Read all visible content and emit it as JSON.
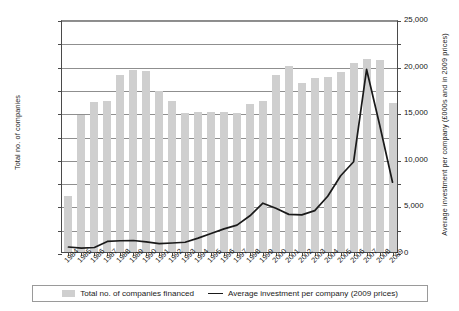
{
  "chart_data": {
    "type": "bar",
    "title": "",
    "subtitle": "",
    "xlabel": "",
    "ylabel": "Total no. of companies",
    "y2label": "Average investment per company (£000s and in 2009 prices)",
    "grid": true,
    "legend_position": "bottom",
    "ylim": [
      0,
      2000
    ],
    "y2lim": [
      0,
      25000
    ],
    "ytick_labels": [
      "0",
      "200",
      "400",
      "600",
      "800",
      "1,000",
      "1,200",
      "1,400",
      "1,600",
      "1,800",
      "2,000"
    ],
    "ytick_values": [
      0,
      200,
      400,
      600,
      800,
      1000,
      1200,
      1400,
      1600,
      1800,
      2000
    ],
    "y2tick_labels": [
      "0",
      "5,000",
      "10,000",
      "15,000",
      "20,000",
      "25,000"
    ],
    "y2tick_values": [
      0,
      5000,
      10000,
      15000,
      20000,
      25000
    ],
    "y2minor_values": [
      2500,
      7500,
      12500,
      17500,
      22500
    ],
    "categories": [
      "1984",
      "1985",
      "1986",
      "1987",
      "1988",
      "1989",
      "1990",
      "1991",
      "1992",
      "1993",
      "1994",
      "1995",
      "1996",
      "1997",
      "1998",
      "1999",
      "2000",
      "2001",
      "2002",
      "2003",
      "2004",
      "2005",
      "2006",
      "2007",
      "2008",
      "2009"
    ],
    "series": [
      {
        "name": "Total no. of companies financed",
        "type": "bar",
        "axis": "left",
        "color": "#cfcfcf",
        "values": [
          480,
          1180,
          1290,
          1295,
          1520,
          1565,
          1555,
          1385,
          1295,
          1195,
          1200,
          1205,
          1200,
          1195,
          1270,
          1300,
          1520,
          1600,
          1455,
          1490,
          1505,
          1545,
          1625,
          1660,
          1650,
          1280
        ]
      },
      {
        "name": "Average investment per company (2009 prices)",
        "type": "line",
        "axis": "right",
        "color": "#1a1a1a",
        "values": [
          750,
          620,
          700,
          1350,
          1420,
          1450,
          1300,
          1120,
          1180,
          1260,
          1700,
          2200,
          2700,
          3100,
          4100,
          5450,
          4900,
          4250,
          4200,
          4650,
          6200,
          8400,
          9900,
          19800,
          13900,
          7700
        ]
      }
    ],
    "legend": [
      {
        "label": "Total no. of companies financed",
        "marker": "bar-swatch"
      },
      {
        "label": "Average investment per company (2009 prices)",
        "marker": "line-swatch"
      }
    ]
  }
}
